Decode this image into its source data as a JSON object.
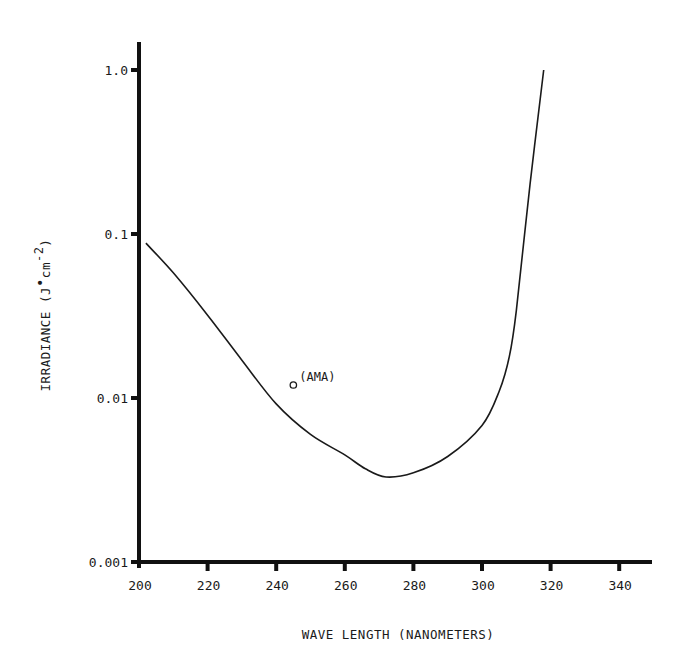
{
  "chart_data": {
    "type": "line",
    "title": "",
    "xlabel": "WAVE LENGTH (NANOMETERS)",
    "ylabel": "IRRADIANCE (J•cm⁻²)",
    "ylabel_parts": {
      "main": "IRRADIANCE (J",
      "dot": "•",
      "unit": "cm",
      "exp": "-2",
      "close": ")"
    },
    "xlim": [
      200,
      350
    ],
    "ylim": [
      0.001,
      1.0
    ],
    "yscale": "log",
    "grid": false,
    "xticks": [
      200,
      220,
      240,
      260,
      280,
      300,
      320,
      340
    ],
    "xtick_labels": [
      "200",
      "220",
      "240",
      "260",
      "280",
      "300",
      "320",
      "340"
    ],
    "yticks": [
      0.001,
      0.01,
      0.1,
      1.0
    ],
    "ytick_labels": [
      "0.001",
      "0.01",
      "0.1",
      "1.0"
    ],
    "series": [
      {
        "name": "threshold curve",
        "x": [
          202,
          210,
          220,
          230,
          240,
          250,
          260,
          266,
          272,
          280,
          290,
          300,
          305,
          308,
          310,
          314,
          318
        ],
        "y": [
          0.088,
          0.058,
          0.032,
          0.017,
          0.0092,
          0.006,
          0.0045,
          0.0037,
          0.0033,
          0.0035,
          0.0044,
          0.0068,
          0.011,
          0.018,
          0.034,
          0.2,
          1.0
        ]
      }
    ],
    "points": [
      {
        "name": "AMA",
        "x": 245,
        "y": 0.012,
        "marker": "open-circle"
      }
    ],
    "annotations": [
      {
        "text": "(AMA)",
        "x": 245,
        "y": 0.012
      }
    ],
    "colors": {
      "line": "#1a1a1a",
      "axis": "#111111",
      "background": "#ffffff"
    }
  }
}
